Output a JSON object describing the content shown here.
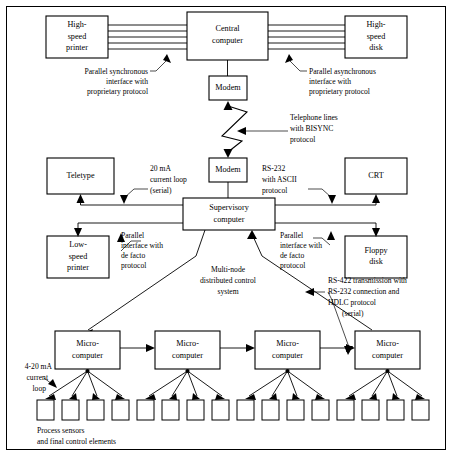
{
  "diagram": {
    "colors": {
      "background": "#ffffff",
      "stroke": "#000000",
      "box_fill": "#ffffff"
    },
    "nodes": {
      "high_speed_printer": {
        "line1": "High-",
        "line2": "speed",
        "line3": "printer"
      },
      "central_computer": {
        "line1": "Central",
        "line2": "computer"
      },
      "high_speed_disk": {
        "line1": "High-",
        "line2": "speed",
        "line3": "disk"
      },
      "modem_top": {
        "line1": "Modem"
      },
      "modem_bottom": {
        "line1": "Modem"
      },
      "teletype": {
        "line1": "Teletype"
      },
      "crt": {
        "line1": "CRT"
      },
      "supervisory_computer": {
        "line1": "Supervisory",
        "line2": "computer"
      },
      "low_speed_printer": {
        "line1": "Low-",
        "line2": "speed",
        "line3": "printer"
      },
      "floppy_disk": {
        "line1": "Floppy",
        "line2": "disk"
      },
      "microcomputer_1": {
        "line1": "Micro-",
        "line2": "computer"
      },
      "microcomputer_2": {
        "line1": "Micro-",
        "line2": "computer"
      },
      "microcomputer_3": {
        "line1": "Micro-",
        "line2": "computer"
      },
      "microcomputer_4": {
        "line1": "Micro-",
        "line2": "computer"
      }
    },
    "annotations": {
      "parallel_sync": {
        "line1": "Parallel synchronous",
        "line2": "interface with",
        "line3": "proprietary protocol"
      },
      "parallel_async": {
        "line1": "Parallel asynchronous",
        "line2": "interface with",
        "line3": "proprietary protocol"
      },
      "telephone_lines": {
        "line1": "Telephone lines",
        "line2": "with BISYNC",
        "line3": "protocol"
      },
      "current_loop_20ma": {
        "line1": "20 mA",
        "line2": "current loop",
        "line3": "(serial)"
      },
      "rs232_ascii": {
        "line1": "RS-232",
        "line2": "with ASCII",
        "line3": "protocol"
      },
      "parallel_defacto_left": {
        "line1": "Parallel",
        "line2": "interface with",
        "line3": "de facto",
        "line4": "protocol"
      },
      "parallel_defacto_right": {
        "line1": "Parallel",
        "line2": "interface with",
        "line3": "de facto",
        "line4": "protocol"
      },
      "multi_node": {
        "line1": "Multi-node",
        "line2": "distributed control",
        "line3": "system"
      },
      "rs422": {
        "line1": "RS-422 transmission with",
        "line2": "RS-232 connection and",
        "line3": "HDLC protocol",
        "line4": "(serial)"
      },
      "current_loop_4_20ma": {
        "line1": "4-20 mA",
        "line2": "current",
        "line3": "loop"
      },
      "process_sensors": {
        "line1": "Process sensors",
        "line2": "and final control elements"
      }
    },
    "sensors": {
      "count_per_microcomputer": 4,
      "total": 16
    },
    "bus_lines": {
      "left_count": 4,
      "right_count": 4
    }
  }
}
